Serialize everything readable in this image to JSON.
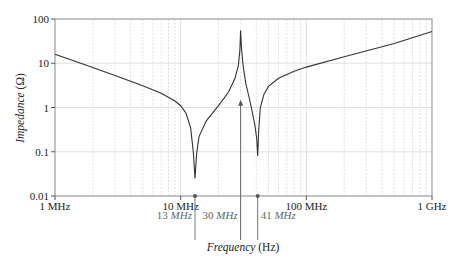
{
  "chart_data": {
    "type": "line",
    "title": "",
    "xlabel": "Frequency (Hz)",
    "ylabel": "Impedance (Ω)",
    "x_scale": "log",
    "y_scale": "log",
    "xlim": [
      1000000.0,
      1000000000.0
    ],
    "ylim": [
      0.01,
      100
    ],
    "grid": true,
    "x_tick_labels": [
      "1 MHz",
      "10 MHz",
      "100 MHz",
      "1 GHz"
    ],
    "x_ticks": [
      1000000.0,
      10000000.0,
      100000000.0,
      1000000000.0
    ],
    "y_tick_labels": [
      "100",
      "10",
      "1",
      "0.1",
      "0.01"
    ],
    "y_ticks": [
      100,
      10,
      1,
      0.1,
      0.01
    ],
    "series": [
      {
        "name": "Impedance",
        "x_mhz": [
          1,
          2,
          3,
          5,
          7,
          9,
          10,
          11,
          12,
          12.6,
          13,
          13.4,
          14,
          16,
          20,
          24,
          27,
          28.8,
          29.6,
          30,
          30.5,
          31.5,
          33,
          36,
          39,
          40.3,
          41,
          41.8,
          43,
          46,
          50,
          60,
          80,
          100,
          200,
          500,
          1000
        ],
        "y_ohm": [
          16,
          8,
          5.3,
          3.1,
          2.1,
          1.4,
          1.1,
          0.75,
          0.35,
          0.1,
          0.025,
          0.09,
          0.22,
          0.5,
          1.1,
          2.2,
          4.5,
          9,
          20,
          55,
          22,
          8,
          3.5,
          1.2,
          0.4,
          0.2,
          0.08,
          0.3,
          1.0,
          2.0,
          3.0,
          4.6,
          6.6,
          8.2,
          14,
          28,
          52
        ]
      }
    ],
    "annotations": [
      {
        "label_num": "13 ",
        "label_unit": "MHz",
        "freq_mhz": 13,
        "marker": "dot"
      },
      {
        "label_num": "30 ",
        "label_unit": "MHz",
        "freq_mhz": 30,
        "marker": "arrow-up",
        "arrow_to_ohm": 1.5
      },
      {
        "label_num": "41 ",
        "label_unit": "MHz",
        "freq_mhz": 41,
        "marker": "dot"
      }
    ],
    "colors": {
      "curve": "#333333",
      "grid": "#d9d9d9",
      "axis": "#555555",
      "annotation": "#777777"
    }
  },
  "axis": {
    "xlabel_word": "Frequency",
    "xlabel_unit": " (Hz)",
    "ylabel_word": "Impedance",
    "ylabel_unit": " (Ω)"
  }
}
